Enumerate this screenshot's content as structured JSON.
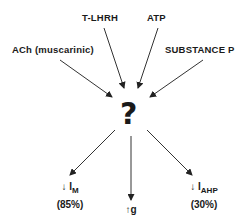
{
  "diagram": {
    "inputs": [
      {
        "label": "T-LHRH"
      },
      {
        "label": "ATP"
      },
      {
        "label": "ACh (muscarinic)"
      },
      {
        "label": "SUBSTANCE P"
      }
    ],
    "center": {
      "label": "?"
    },
    "outputs": [
      {
        "arrow": "↓",
        "symbol": "I",
        "subscript": "M",
        "percent": "(85%)"
      },
      {
        "arrow": "↑",
        "symbol": "g",
        "subscript": "",
        "percent": ""
      },
      {
        "arrow": "↓",
        "symbol": "I",
        "subscript": "AHP",
        "percent": "(30%)"
      }
    ]
  }
}
